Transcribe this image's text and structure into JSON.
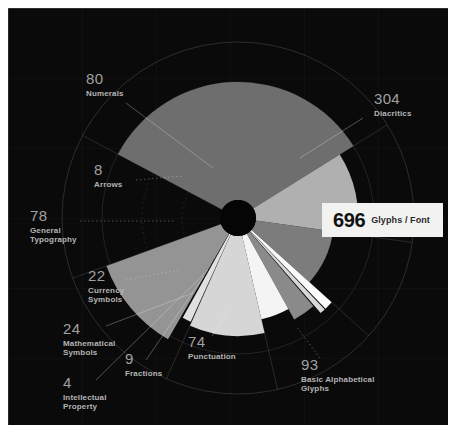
{
  "panel": {
    "background_color": "#0a0a0a",
    "hub_color": "#050505"
  },
  "callout": {
    "value": "696",
    "label": "Glyphs / Font",
    "background_color": "#f2f2f0"
  },
  "chart_data": {
    "type": "pie",
    "variant": "rose-nightingale-polar-area",
    "title": "",
    "subtitle": "",
    "xlabel": "",
    "ylabel": "",
    "total": 696,
    "total_label": "Glyphs / Font",
    "grid": true,
    "legend_position": "annotations",
    "radial_ticks": [
      174,
      348,
      522,
      696
    ],
    "categories": [
      "Diacritics",
      "Basic Alphabetical Glyphs",
      "Punctuation",
      "Fractions",
      "Intellectual Property",
      "Mathematical Symbols",
      "Currency Symbols",
      "General Typography",
      "Arrows",
      "Numerals"
    ],
    "values": [
      304,
      93,
      74,
      9,
      4,
      24,
      22,
      78,
      8,
      80
    ],
    "slices": [
      {
        "label": "Diacritics",
        "value": 304,
        "color": "#6e6e6e",
        "start_angle": -62,
        "end_angle": 58,
        "radius": 136
      },
      {
        "label": "Basic Alphabetical Glyphs",
        "value": 93,
        "color": "#b0b0b0",
        "start_angle": 58,
        "end_angle": 98,
        "radius": 120
      },
      {
        "label": "Punctuation",
        "value": 74,
        "color": "#7c7c7c",
        "start_angle": 98,
        "end_angle": 132,
        "radius": 96
      },
      {
        "label": "Fractions",
        "value": 9,
        "color": "#fbfbfb",
        "start_angle": 132,
        "end_angle": 136,
        "radius": 126
      },
      {
        "label": "Intellectual Property",
        "value": 4,
        "color": "#d8d8d8",
        "start_angle": 136.5,
        "end_angle": 139,
        "radius": 126
      },
      {
        "label": "Mathematical Symbols",
        "value": 24,
        "color": "#8a8a8a",
        "start_angle": 139.5,
        "end_angle": 151,
        "radius": 116
      },
      {
        "label": "Currency Symbols",
        "value": 22,
        "color": "#f4f4f4",
        "start_angle": 151,
        "end_angle": 167,
        "radius": 104
      },
      {
        "label": "General Typography",
        "value": 78,
        "color": "#d6d6d6",
        "start_angle": 167,
        "end_angle": 204,
        "radius": 118
      },
      {
        "label": "Arrows",
        "value": 8,
        "color": "#e0e0e0",
        "start_angle": 204.5,
        "end_angle": 209,
        "radius": 114
      },
      {
        "label": "Numerals",
        "value": 80,
        "color": "#949494",
        "start_angle": 210,
        "end_angle": 250,
        "radius": 140
      }
    ]
  },
  "annotations": [
    {
      "name": "numerals",
      "number": "80",
      "caption_line1": "Numerals",
      "caption_line2": ""
    },
    {
      "name": "diacritics",
      "number": "304",
      "caption_line1": "Diacritics",
      "caption_line2": ""
    },
    {
      "name": "arrows",
      "number": "8",
      "caption_line1": "Arrows",
      "caption_line2": ""
    },
    {
      "name": "general-typography",
      "number": "78",
      "caption_line1": "General",
      "caption_line2": "Typography"
    },
    {
      "name": "currency-symbols",
      "number": "22",
      "caption_line1": "Currency",
      "caption_line2": "Symbols"
    },
    {
      "name": "mathematical-symbols",
      "number": "24",
      "caption_line1": "Mathematical",
      "caption_line2": "Symbols"
    },
    {
      "name": "fractions",
      "number": "9",
      "caption_line1": "Fractions",
      "caption_line2": ""
    },
    {
      "name": "intellectual-property",
      "number": "4",
      "caption_line1": "Intellectual",
      "caption_line2": "Property"
    },
    {
      "name": "punctuation",
      "number": "74",
      "caption_line1": "Punctuation",
      "caption_line2": ""
    },
    {
      "name": "basic-alphabetical",
      "number": "93",
      "caption_line1": "Basic Alphabetical",
      "caption_line2": "Glyphs"
    }
  ]
}
